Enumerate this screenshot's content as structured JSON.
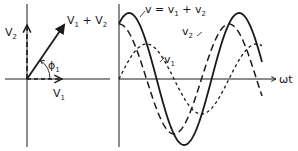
{
  "phasor": {
    "labels": {
      "v2": "V",
      "v2_sub": "2",
      "v1": "V",
      "v1_sub": "1",
      "sum_v1": "V",
      "sum_v1_sub": "1",
      "sum_plus": " + ",
      "sum_v2": "V",
      "sum_v2_sub": "2",
      "angle": "ϕ",
      "angle_sub": "1"
    }
  },
  "waveform": {
    "axis_label": "ωt",
    "labels": {
      "v_total": "v = v",
      "v_total_sub1": "1",
      "v_total_plus": " + v",
      "v_total_sub2": "2",
      "v2": "v",
      "v2_sub": "2",
      "v1": "v",
      "v1_sub": "1"
    },
    "series": [
      {
        "name": "v1",
        "style": "short-dash",
        "amplitude": 35,
        "phase_deg": 0
      },
      {
        "name": "v2",
        "style": "long-dash",
        "amplitude": 55,
        "phase_deg": 90
      },
      {
        "name": "v",
        "style": "solid",
        "amplitude": 66,
        "phase_deg": 57
      }
    ]
  },
  "colors": {
    "ink": "#1a1a1a",
    "background": "#ffffff"
  }
}
